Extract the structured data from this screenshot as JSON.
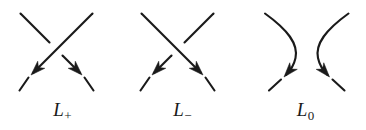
{
  "figure": {
    "kind": "skein-relation-diagram",
    "background_color": "#ffffff",
    "stroke_color": "#1a1a1a",
    "width": 366,
    "height": 130
  },
  "panels": [
    {
      "id": "l-plus",
      "label_base": "L",
      "label_sub": "+",
      "label_text": "L+",
      "crossing_type": "positive",
      "over_strand": "northeast-to-southwest",
      "under_strand": "northwest-to-southeast",
      "arrow_count": 2,
      "arrow_directions": [
        "southwest",
        "southeast"
      ]
    },
    {
      "id": "l-minus",
      "label_base": "L",
      "label_sub": "−",
      "label_text": "L−",
      "crossing_type": "negative",
      "over_strand": "northwest-to-southeast",
      "under_strand": "northeast-to-southwest",
      "arrow_count": 2,
      "arrow_directions": [
        "southwest",
        "southeast"
      ]
    },
    {
      "id": "l-zero",
      "label_base": "L",
      "label_sub": "0",
      "label_text": "L0",
      "crossing_type": "smoothing",
      "over_strand": "none",
      "under_strand": "none",
      "arrow_count": 2,
      "arrow_directions": [
        "south",
        "south"
      ]
    }
  ]
}
